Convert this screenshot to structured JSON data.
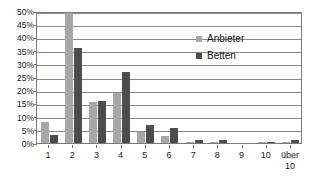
{
  "chart_data": {
    "type": "bar",
    "title": "",
    "subtitle": "",
    "xlabel": "",
    "ylabel": "",
    "categories": [
      "1",
      "2",
      "3",
      "4",
      "5",
      "6",
      "7",
      "8",
      "9",
      "10",
      "über 10"
    ],
    "series": [
      {
        "name": "Anbieter",
        "color": "#a6a6a6",
        "values": [
          8,
          52,
          15.5,
          19,
          4,
          2.5,
          0.5,
          0.5,
          0,
          0.3,
          0.3
        ]
      },
      {
        "name": "Betten",
        "color": "#4d4d4d",
        "values": [
          3,
          36,
          16,
          27,
          7,
          5.5,
          1.3,
          1.3,
          0,
          0.3,
          1
        ]
      }
    ],
    "ylim": [
      0,
      50
    ],
    "ytick_values": [
      0,
      5,
      10,
      15,
      20,
      25,
      30,
      35,
      40,
      45,
      50
    ],
    "ytick_labels": [
      "0%",
      "5%",
      "10%",
      "15%",
      "20%",
      "25%",
      "30%",
      "35%",
      "40%",
      "45%",
      "50%"
    ],
    "grid": true,
    "grid_axis": "y",
    "legend_position": "inside-upper-right",
    "value_format": "percent"
  },
  "legend": {
    "entries": [
      {
        "label": "Anbieter",
        "color": "#a6a6a6"
      },
      {
        "label": "Betten",
        "color": "#4d4d4d"
      }
    ]
  },
  "colors": {
    "anbieter": "#a6a6a6",
    "betten": "#4d4d4d",
    "grid": "#8a8a8a",
    "frame": "#7a7a7a",
    "text": "#1a1a1a",
    "background": "#ffffff"
  }
}
